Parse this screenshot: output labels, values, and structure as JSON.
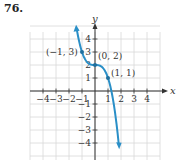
{
  "problem": {
    "number": "76."
  },
  "chart_data": {
    "type": "line",
    "title": "",
    "xlabel": "x",
    "ylabel": "y",
    "xlim": [
      -5,
      5
    ],
    "ylim": [
      -5,
      5
    ],
    "grid": true,
    "x_ticks": [
      -4,
      -3,
      -2,
      -1,
      1,
      2,
      3,
      4
    ],
    "y_ticks": [
      -4,
      -3,
      -2,
      -1,
      1,
      2,
      3,
      4
    ],
    "x_tick_labels": [
      "−4",
      "−3",
      "−2",
      "−1",
      "1",
      "2",
      "3",
      "4"
    ],
    "y_tick_labels": [
      "−4",
      "−3",
      "−2",
      "−1",
      "1",
      "2",
      "3",
      "4"
    ],
    "series": [
      {
        "name": "f(x) = -x^3 + 2",
        "color": "#2a8fc7",
        "x": [
          -1.4,
          -1.2,
          -1,
          -0.8,
          -0.5,
          0,
          0.5,
          0.8,
          1,
          1.2,
          1.5,
          1.65,
          1.8
        ],
        "y": [
          4.74,
          3.73,
          3,
          2.51,
          2.13,
          2,
          1.88,
          1.49,
          1,
          0.27,
          -1.38,
          -2.49,
          -3.83
        ],
        "arrows": "both"
      }
    ],
    "annotations": [
      {
        "label": "(−1, 3)",
        "x": -1,
        "y": 3
      },
      {
        "label": "(0, 2)",
        "x": 0,
        "y": 2
      },
      {
        "label": "(1, 1)",
        "x": 1,
        "y": 1
      }
    ]
  }
}
